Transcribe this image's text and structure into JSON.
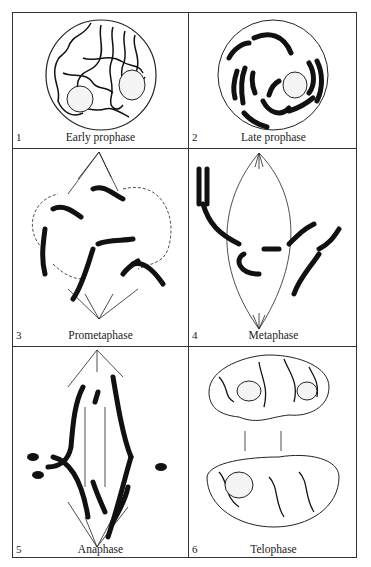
{
  "figure": {
    "panels": [
      {
        "number": "1",
        "caption": "Early prophase"
      },
      {
        "number": "2",
        "caption": "Late prophase"
      },
      {
        "number": "3",
        "caption": "Prometaphase"
      },
      {
        "number": "4",
        "caption": "Metaphase"
      },
      {
        "number": "5",
        "caption": "Anaphase"
      },
      {
        "number": "6",
        "caption": "Telophase"
      }
    ]
  }
}
